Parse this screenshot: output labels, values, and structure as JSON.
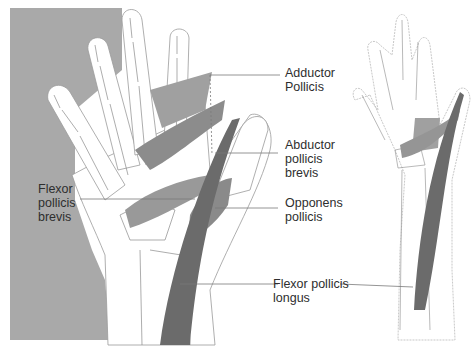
{
  "figure": {
    "colors": {
      "background": "#ffffff",
      "side_panel": "#a9a9a9",
      "outline": "#9a9a9a",
      "muscle_light": "#a0a0a0",
      "muscle_mid": "#8c8c8c",
      "muscle_dark": "#6b6b6b",
      "leader_line": "#7a7a7a",
      "text": "#2e2e2e"
    },
    "labels": {
      "adductor_pollicis": "Adductor\nPollicis",
      "abductor_pollicis_brevis": "Abductor\npollicis\nbrevis",
      "flexor_pollicis_brevis": "Flexor\npollicis\nbrevis",
      "opponens_pollicis": "Opponens\npollicis",
      "flexor_pollicis_longus": "Flexor pollicis\nlongus"
    }
  }
}
